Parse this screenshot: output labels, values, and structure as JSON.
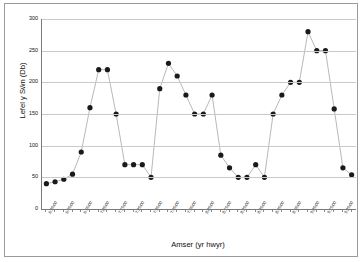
{
  "chart_data": {
    "type": "line",
    "title": "",
    "xlabel": "Amser (yr hwyr)",
    "ylabel": "Lefel y Sŵn (Db)",
    "ylim": [
      0,
      300
    ],
    "ytick_labels": [
      "300",
      "250",
      "200",
      "150",
      "100",
      "50",
      "0"
    ],
    "ytick_values": [
      300,
      250,
      200,
      150,
      100,
      50,
      0
    ],
    "grid": true,
    "legend": "none",
    "marker": "filled-circle",
    "marker_color": "#1a1a1a",
    "line_color": "#a6a6a6",
    "categories": [
      "6:35:00",
      "6:40:00",
      "6:45:00",
      "6:50:00",
      "6:55:00",
      "7:00:00",
      "7:05:00",
      "7:10:00",
      "7:15:00",
      "7:20:00",
      "7:25:00",
      "7:30:00",
      "7:35:00",
      "7:40:00",
      "7:45:00",
      "7:50:00",
      "7:55:00",
      "8:00:00",
      "8:05:00",
      "8:10:00",
      "8:15:00",
      "8:20:00",
      "8:25:00",
      "8:30:00",
      "8:35:00",
      "8:40:00",
      "8:45:00",
      "8:50:00",
      "8:55:00",
      "9:00:00",
      "9:05:00",
      "9:10:00",
      "9:15:00",
      "9:20:00",
      "9:25:00",
      "9:30:00"
    ],
    "xtick_labels": [
      "6:35:00",
      "6:45:00",
      "6:55:00",
      "7:05:00",
      "7:15:00",
      "7:25:00",
      "7:35:00",
      "7:45:00",
      "7:55:00",
      "8:05:00",
      "8:15:00",
      "8:25:00",
      "8:35:00",
      "8:45:00",
      "8:55:00",
      "9:05:00",
      "9:15:00",
      "9:25:00"
    ],
    "values": [
      40,
      43,
      47,
      55,
      90,
      160,
      220,
      220,
      150,
      70,
      70,
      70,
      50,
      190,
      230,
      210,
      180,
      150,
      150,
      180,
      85,
      65,
      50,
      50,
      70,
      50,
      150,
      180,
      200,
      200,
      280,
      250,
      250,
      158,
      65,
      54
    ]
  }
}
